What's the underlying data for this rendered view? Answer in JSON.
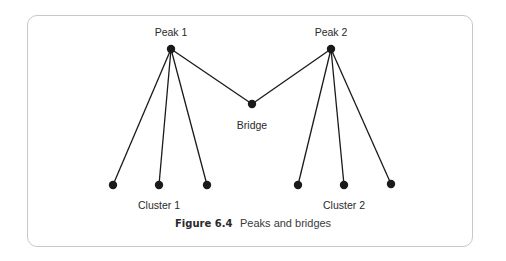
{
  "figure": {
    "caption_number": "Figure 6.4",
    "caption_text": "Peaks and bridges"
  },
  "diagram": {
    "nodes": [
      {
        "id": "peak1",
        "label": "Peak 1"
      },
      {
        "id": "peak2",
        "label": "Peak 2"
      },
      {
        "id": "bridge",
        "label": "Bridge"
      },
      {
        "id": "c1a",
        "label": ""
      },
      {
        "id": "c1b",
        "label": "Cluster 1"
      },
      {
        "id": "c1c",
        "label": ""
      },
      {
        "id": "c2a",
        "label": ""
      },
      {
        "id": "c2b",
        "label": "Cluster 2"
      },
      {
        "id": "c2c",
        "label": ""
      }
    ],
    "edges": [
      [
        "peak1",
        "c1a"
      ],
      [
        "peak1",
        "c1b"
      ],
      [
        "peak1",
        "c1c"
      ],
      [
        "peak1",
        "bridge"
      ],
      [
        "peak2",
        "bridge"
      ],
      [
        "peak2",
        "c2a"
      ],
      [
        "peak2",
        "c2b"
      ],
      [
        "peak2",
        "c2c"
      ]
    ],
    "labels": {
      "peak1": "Peak 1",
      "peak2": "Peak 2",
      "bridge": "Bridge",
      "cluster1": "Cluster 1",
      "cluster2": "Cluster 2"
    },
    "colors": {
      "node": "#1a1a1a",
      "edge": "#1a1a1a",
      "frame": "#c8c8c8"
    }
  }
}
